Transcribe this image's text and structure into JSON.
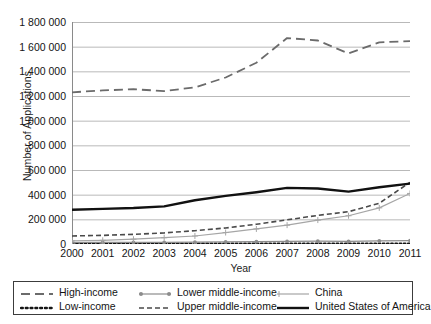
{
  "chart_data": {
    "type": "line",
    "title": "",
    "xlabel": "Year",
    "ylabel": "Number of Applications",
    "x": [
      2000,
      2001,
      2002,
      2003,
      2004,
      2005,
      2006,
      2007,
      2008,
      2009,
      2010,
      2011
    ],
    "categories": [
      "2000",
      "2001",
      "2002",
      "2003",
      "2004",
      "2005",
      "2006",
      "2007",
      "2008",
      "2009",
      "2010",
      "2011"
    ],
    "xlim": [
      2000,
      2011
    ],
    "ylim": [
      0,
      1800000
    ],
    "ytick_step": 200000,
    "ytick_labels": [
      "1 800 000",
      "1 600 000",
      "1 400 000",
      "1 200 000",
      "1 000 000",
      "800 000",
      "600 000",
      "400 000",
      "200 000",
      "0"
    ],
    "ytick_values": [
      1800000,
      1600000,
      1400000,
      1200000,
      1000000,
      800000,
      600000,
      400000,
      200000,
      0
    ],
    "grid": true,
    "grid_axis": "y",
    "legend_position": "bottom",
    "series": [
      {
        "name": "High-income",
        "style": "long-dash",
        "color": "#6b6b6b",
        "width": 1.8,
        "marker": "none",
        "values": [
          1230000,
          1245000,
          1255000,
          1240000,
          1270000,
          1350000,
          1470000,
          1670000,
          1650000,
          1545000,
          1635000,
          1645000
        ]
      },
      {
        "name": "Low-income",
        "style": "dotted",
        "color": "#141414",
        "width": 2.2,
        "marker": "none",
        "values": [
          2000,
          2200,
          2300,
          2400,
          2600,
          2900,
          3100,
          3400,
          3600,
          3500,
          3800,
          4100
        ]
      },
      {
        "name": "Lower middle-income",
        "style": "solid",
        "color": "#8c8c8c",
        "width": 1.2,
        "marker": "circle",
        "values": [
          12000,
          12500,
          13000,
          13500,
          15000,
          17000,
          19000,
          21000,
          23000,
          22000,
          25000,
          28000
        ]
      },
      {
        "name": "Upper middle-income",
        "style": "short-dash",
        "color": "#4a4a4a",
        "width": 1.6,
        "marker": "none",
        "values": [
          65000,
          70000,
          78000,
          90000,
          108000,
          130000,
          160000,
          196000,
          232000,
          262000,
          330000,
          500000
        ]
      },
      {
        "name": "China",
        "style": "solid",
        "color": "#a6a6a6",
        "width": 1.2,
        "marker": "plus",
        "values": [
          25000,
          30000,
          39000,
          51000,
          65000,
          93000,
          122000,
          153000,
          194000,
          229000,
          293000,
          410000
        ]
      },
      {
        "name": "United States of America",
        "style": "solid",
        "color": "#111111",
        "width": 2.4,
        "marker": "none",
        "values": [
          278000,
          285000,
          292000,
          305000,
          355000,
          390000,
          420000,
          455000,
          450000,
          425000,
          460000,
          490000
        ]
      }
    ]
  },
  "legend": {
    "entries": [
      {
        "label": "High-income",
        "swatch": "long-dash-swatch",
        "row": 0,
        "col": 0
      },
      {
        "label": "Lower middle-income",
        "swatch": "circle-line-swatch",
        "row": 0,
        "col": 1
      },
      {
        "label": "China",
        "swatch": "plus-line-swatch",
        "row": 0,
        "col": 2
      },
      {
        "label": "Low-income",
        "swatch": "dotted-swatch",
        "row": 1,
        "col": 0
      },
      {
        "label": "Upper middle-income",
        "swatch": "short-dash-swatch",
        "row": 1,
        "col": 1
      },
      {
        "label": "United States of America",
        "swatch": "solid-black-swatch",
        "row": 1,
        "col": 2
      }
    ]
  },
  "colors": {
    "grid": "#b9b9b9",
    "axis": "#8a8a8a",
    "high_income": "#6b6b6b",
    "low_income": "#141414",
    "lower_middle_income": "#8c8c8c",
    "upper_middle_income": "#4a4a4a",
    "china": "#a6a6a6",
    "usa": "#111111",
    "legend_border": "#3c3c3c",
    "background": "#ffffff"
  }
}
